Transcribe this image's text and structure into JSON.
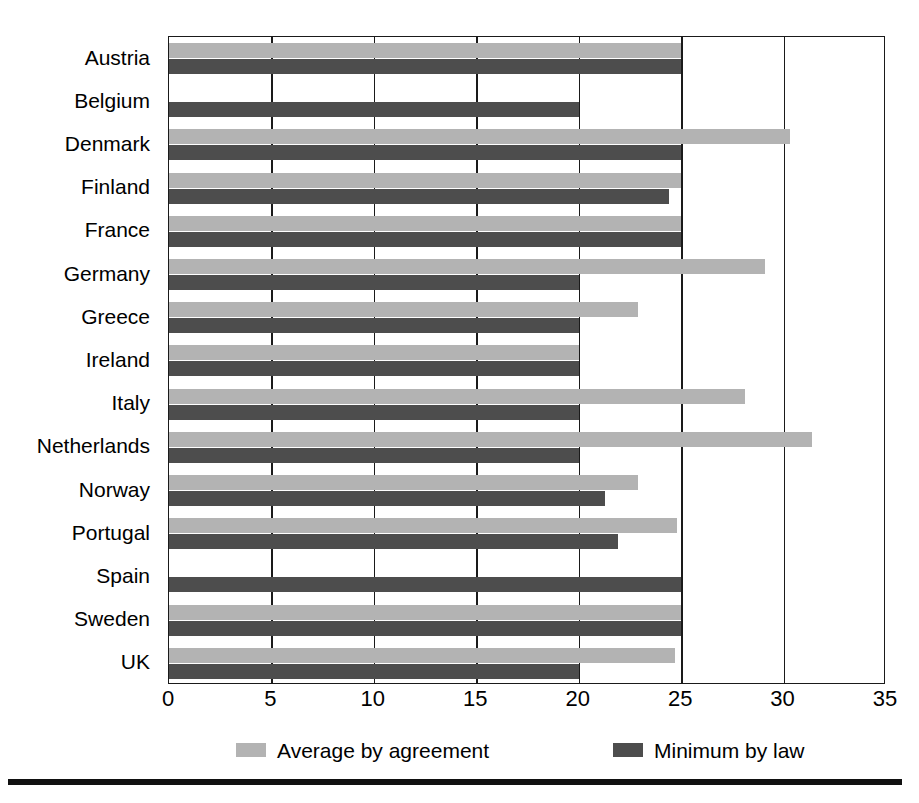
{
  "chart_data": {
    "type": "bar",
    "orientation": "horizontal",
    "title": "",
    "subtitle": "",
    "xlabel": "",
    "ylabel": "",
    "xlim": [
      0,
      35
    ],
    "xticks": [
      0,
      5,
      10,
      15,
      20,
      25,
      30,
      35
    ],
    "xtick_labels": [
      "0",
      "5",
      "10",
      "15",
      "20",
      "25",
      "30",
      "35"
    ],
    "grid": true,
    "grid_axis": "x",
    "legend_position": "bottom",
    "categories": [
      "Austria",
      "Belgium",
      "Denmark",
      "Finland",
      "France",
      "Germany",
      "Greece",
      "Ireland",
      "Italy",
      "Netherlands",
      "Norway",
      "Portugal",
      "Spain",
      "Sweden",
      "UK"
    ],
    "series": [
      {
        "name": "Average by agreement",
        "color": "#b3b3b3",
        "values": [
          25,
          null,
          30.3,
          25,
          25,
          29.1,
          22.9,
          20,
          28.1,
          31.4,
          22.9,
          24.8,
          null,
          25,
          24.7
        ]
      },
      {
        "name": "Minimum by law",
        "color": "#4d4d4d",
        "values": [
          25,
          20,
          25,
          24.4,
          25,
          20,
          20,
          20,
          20,
          20,
          21.3,
          21.9,
          25,
          25,
          20
        ]
      }
    ]
  },
  "legend": {
    "items": [
      {
        "label": "Average by agreement",
        "color": "#b3b3b3"
      },
      {
        "label": "Minimum by law",
        "color": "#4d4d4d"
      }
    ]
  },
  "colors": {
    "light_bar": "#b3b3b3",
    "dark_bar": "#4d4d4d",
    "axis": "#1a1a1a",
    "background": "#ffffff"
  }
}
